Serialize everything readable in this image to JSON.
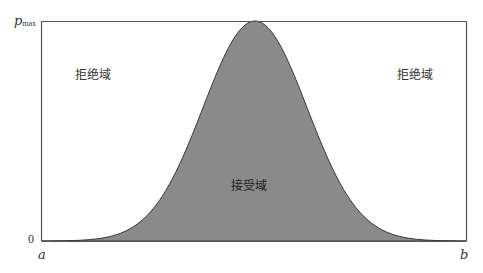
{
  "diagram": {
    "type": "gaussian-acceptance-region",
    "y_axis": {
      "top_label_main": "p",
      "top_label_sub": "max",
      "bottom_label": "0"
    },
    "x_axis": {
      "left_label": "a",
      "right_label": "b"
    },
    "regions": {
      "left_reject": "拒绝域",
      "right_reject": "拒绝域",
      "accept": "接受域"
    },
    "colors": {
      "fill": "#8a8a8a",
      "stroke": "#3a3a3a",
      "frame": "#555555",
      "text": "#333333"
    }
  }
}
